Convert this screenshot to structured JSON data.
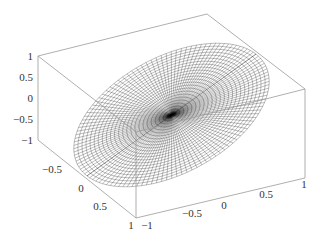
{
  "chart_data": {
    "type": "surface3d",
    "title": "",
    "axes": {
      "x": {
        "range": [
          -1,
          1
        ],
        "ticks": [
          "-1",
          "-0.5",
          "0",
          "0.5",
          "1"
        ]
      },
      "y": {
        "range": [
          -1,
          1
        ],
        "ticks": [
          "-0.5",
          "0",
          "0.5",
          "1"
        ]
      },
      "z": {
        "range": [
          -1,
          1
        ],
        "ticks": [
          "1",
          "0.5",
          "0",
          "-0.5",
          "-1"
        ]
      }
    },
    "grid": false,
    "mesh": {
      "u_lines": 60,
      "v_lines": 24,
      "color": "#000000"
    },
    "box_color": "#9a9a9a"
  },
  "labels": {
    "z_ticks": [
      {
        "text": "1",
        "x": 31,
        "y": 60
      },
      {
        "text": "0.5",
        "x": 31,
        "y": 81
      },
      {
        "text": "0",
        "x": 31,
        "y": 102
      },
      {
        "text": "−0.5",
        "x": 31,
        "y": 123
      },
      {
        "text": "−1",
        "x": 31,
        "y": 144
      }
    ],
    "y_ticks": [
      {
        "text": "−0.5",
        "x": 58,
        "y": 173
      },
      {
        "text": "0",
        "x": 83,
        "y": 192
      },
      {
        "text": "0.5",
        "x": 104,
        "y": 210
      },
      {
        "text": "1",
        "x": 132,
        "y": 229
      }
    ],
    "x_ticks": [
      {
        "text": "−1",
        "x": 147,
        "y": 229
      },
      {
        "text": "−0.5",
        "x": 192,
        "y": 217
      },
      {
        "text": "0",
        "x": 225,
        "y": 208
      },
      {
        "text": "0.5",
        "x": 268,
        "y": 197
      },
      {
        "text": "1",
        "x": 304,
        "y": 187
      }
    ]
  }
}
